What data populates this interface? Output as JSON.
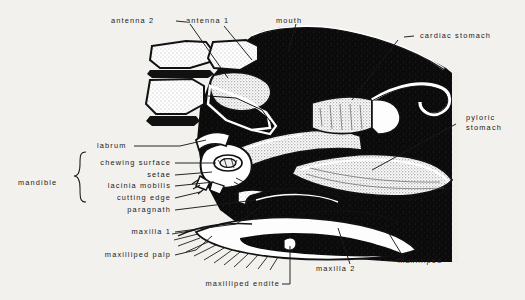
{
  "figure": {
    "kind": "anatomical-line-drawing",
    "background_color": "#f2f1ed",
    "ink_color": "#111111",
    "paper_tone": "#efeee9"
  },
  "labels": {
    "antenna_2": "antenna 2",
    "antenna_1": "antenna 1",
    "mouth": "mouth",
    "cardiac_stomach": "cardiac stomach",
    "pyloric_stomach_line1": "pyloric",
    "pyloric_stomach_line2": "stomach",
    "labrum": "labrum",
    "mandible": "mandible",
    "chewing_surface": "chewing surface",
    "setae": "setae",
    "lacinia_mobilis": "lacinia mobilis",
    "cutting_edge": "cutting edge",
    "paragnath": "paragnath",
    "maxilla_1": "maxilla 1",
    "maxilliped_palp": "maxilliped palp",
    "maxilliped_endite": "maxilliped endite",
    "maxilla_2": "maxilla 2",
    "maxilliped": "maxilliped"
  },
  "mandible_group": {
    "bracket_label": "mandible",
    "items": [
      "chewing surface",
      "setae",
      "lacinia mobilis",
      "cutting edge"
    ]
  }
}
